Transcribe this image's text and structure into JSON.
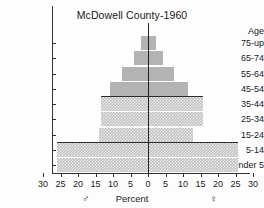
{
  "chart_data": {
    "type": "bar",
    "title": "McDowell County-1960",
    "subtitle": "",
    "xlabel": "Percent",
    "ylabel": "Age",
    "xlim": [
      -30,
      30
    ],
    "ylim": [
      0,
      9
    ],
    "grid": false,
    "legend_position": "bottom",
    "orientation": "horizontal-population-pyramid",
    "x_tick_labels": [
      "30",
      "25",
      "20",
      "15",
      "10",
      "5",
      "0",
      "5",
      "10",
      "15",
      "20",
      "25",
      "30"
    ],
    "x_tick_values": [
      -30,
      -25,
      -20,
      -15,
      -10,
      -5,
      0,
      5,
      10,
      15,
      20,
      25,
      30
    ],
    "categories": [
      "75-up",
      "65-74",
      "55-64",
      "45-54",
      "35-44",
      "25-34",
      "15-24",
      "5-14",
      "Under 5"
    ],
    "series": [
      {
        "name": "Male",
        "symbol": "♂",
        "side": "left",
        "values": [
          2.0,
          4.0,
          7.5,
          11.0,
          13.5,
          13.5,
          14.0,
          26.0,
          26.0
        ]
      },
      {
        "name": "Female",
        "symbol": "♀",
        "side": "right",
        "values": [
          2.0,
          4.0,
          7.0,
          11.0,
          15.5,
          15.5,
          12.5,
          25.5,
          25.5
        ]
      }
    ],
    "annotations": [
      {
        "name": "rule-above-35-44",
        "type": "horizontal-rule",
        "at_category": "35-44",
        "edge": "top"
      },
      {
        "name": "rule-above-5-14",
        "type": "horizontal-rule",
        "at_category": "5-14",
        "edge": "top"
      }
    ],
    "colors": {
      "bar_solid": "#b3b3b3",
      "bar_textured": "#bfbfbf",
      "axis": "#333333",
      "text": "#1a1a1a",
      "background": "#fdfdfd"
    },
    "bar_styles": [
      "solid",
      "solid",
      "solid",
      "solid",
      "dotted",
      "dotted",
      "dotted",
      "dotted",
      "dotted"
    ]
  },
  "chart": {
    "title": "McDowell County-1960",
    "y_axis_title": "Age",
    "x_axis_title": "Percent",
    "male_symbol": "♂",
    "female_symbol": "♀"
  }
}
